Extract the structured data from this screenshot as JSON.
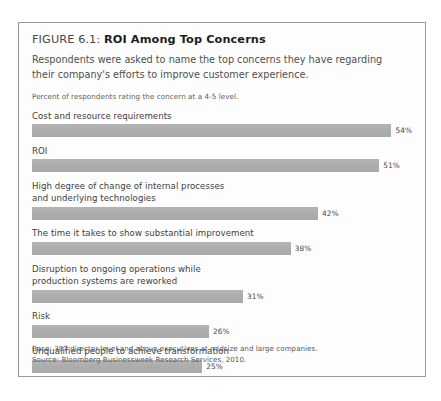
{
  "figure": {
    "label": "FIGURE 6.1:",
    "title": "ROI Among Top Concerns",
    "subtitle": "Respondents were asked to name the top concerns they have regarding their company's efforts to improve customer experience.",
    "axis_note": "Percent of respondents rating the concern at a 4-5 level.",
    "base_note": "Base: 307 director-level and above executives at midsize and large companies.",
    "source_note": "Source: Bloomberg Businessweek Research Services, 2010."
  },
  "colors": {
    "bar": "#b0b0b0",
    "border": "#9a9a9a",
    "title": "#1d1d1d",
    "body_text": "#4f4f4f"
  },
  "chart_data": {
    "type": "bar",
    "orientation": "horizontal",
    "title": "ROI Among Top Concerns",
    "subtitle": "Respondents were asked to name the top concerns they have regarding their company's efforts to improve customer experience.",
    "xlabel": "Percent of respondents rating the concern at a 4-5 level.",
    "ylabel": "",
    "xlim": [
      0,
      60
    ],
    "grid": false,
    "legend": "none",
    "unit": "%",
    "categories": [
      "Cost and resource requirements",
      "ROI",
      "High degree of change of internal processes and underlying technologies",
      "The time it takes to show substantial improvement",
      "Disruption to ongoing operations while production systems are reworked",
      "Risk",
      "Unqualified people to achieve transformation"
    ],
    "values": [
      54,
      51,
      42,
      38,
      31,
      26,
      25
    ],
    "data_labels": [
      "54%",
      "51%",
      "42%",
      "38%",
      "31%",
      "26%",
      "25%"
    ],
    "annotations": [
      "Base: 307 director-level and above executives at midsize and large companies.",
      "Source: Bloomberg Businessweek Research Services, 2010."
    ]
  },
  "bars": [
    {
      "label": "Cost and resource requirements",
      "value": 54,
      "value_label": "54%"
    },
    {
      "label": "ROI",
      "value": 51,
      "value_label": "51%"
    },
    {
      "label": "High degree of change of internal processes\nand underlying technologies",
      "value": 42,
      "value_label": "42%"
    },
    {
      "label": "The time it takes to show substantial improvement",
      "value": 38,
      "value_label": "38%"
    },
    {
      "label": "Disruption to ongoing operations while\nproduction systems are reworked",
      "value": 31,
      "value_label": "31%"
    },
    {
      "label": "Risk",
      "value": 26,
      "value_label": "26%"
    },
    {
      "label": "Unqualified people to achieve transformation",
      "value": 25,
      "value_label": "25%"
    }
  ]
}
